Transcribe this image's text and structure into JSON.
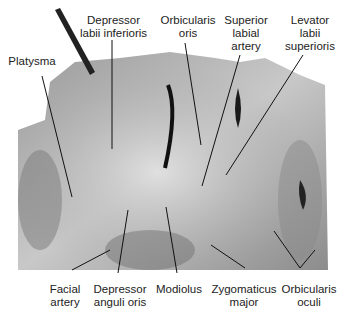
{
  "figure": {
    "type": "anatomical-dissection-photo",
    "labels_top": [
      {
        "id": "platysma",
        "lines": [
          "Platysma"
        ]
      },
      {
        "id": "depressor-labii-inferioris",
        "lines": [
          "Depressor",
          "labii inferioris"
        ]
      },
      {
        "id": "orbicularis-oris",
        "lines": [
          "Orbicularis",
          "oris"
        ]
      },
      {
        "id": "superior-labial-artery",
        "lines": [
          "Superior",
          "labial",
          "artery"
        ]
      },
      {
        "id": "levator-labii-superioris",
        "lines": [
          "Levator",
          "labii",
          "superioris"
        ]
      }
    ],
    "labels_bottom": [
      {
        "id": "facial-artery",
        "lines": [
          "Facial",
          "artery"
        ]
      },
      {
        "id": "depressor-anguli-oris",
        "lines": [
          "Depressor",
          "anguli oris"
        ]
      },
      {
        "id": "modiolus",
        "lines": [
          "Modiolus"
        ]
      },
      {
        "id": "zygomaticus-major",
        "lines": [
          "Zygomaticus",
          "major"
        ]
      },
      {
        "id": "orbicularis-oculi",
        "lines": [
          "Orbicularis",
          "oculi"
        ]
      }
    ]
  }
}
